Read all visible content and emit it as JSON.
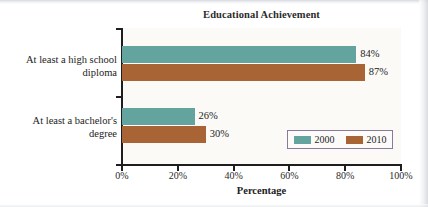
{
  "chart_data": {
    "type": "bar",
    "orientation": "horizontal",
    "title": "Educational Achievement",
    "xlabel": "Percentage",
    "ylabel": "",
    "xlim": [
      0,
      100
    ],
    "xticks": [
      "0%",
      "20%",
      "40%",
      "60%",
      "80%",
      "100%"
    ],
    "xtick_values": [
      0,
      20,
      40,
      60,
      80,
      100
    ],
    "grid": false,
    "legend_position": "inside-lower-right",
    "categories": [
      "At least a high school diploma",
      "At least a bachelor's degree"
    ],
    "category_lines": [
      [
        "At least a high school",
        "diploma"
      ],
      [
        "At least a bachelor's",
        "degree"
      ]
    ],
    "series": [
      {
        "name": "2000",
        "color": "#63a49f",
        "values": [
          84,
          26
        ],
        "labels": [
          "84%",
          "26%"
        ]
      },
      {
        "name": "2010",
        "color": "#a86435",
        "values": [
          87,
          30
        ],
        "labels": [
          "87%",
          "30%"
        ]
      }
    ]
  },
  "legend": {
    "border_color": "#897a9c",
    "entries": [
      {
        "label": "2000",
        "color": "#63a49f"
      },
      {
        "label": "2010",
        "color": "#a86435"
      }
    ]
  },
  "colors": {
    "series_2000": "#63a49f",
    "series_2010": "#a86435",
    "axis": "#1e1e1e",
    "plot_background": "#fbfaf7",
    "legend_border": "#897a9c",
    "text": "#1c1c1c"
  }
}
